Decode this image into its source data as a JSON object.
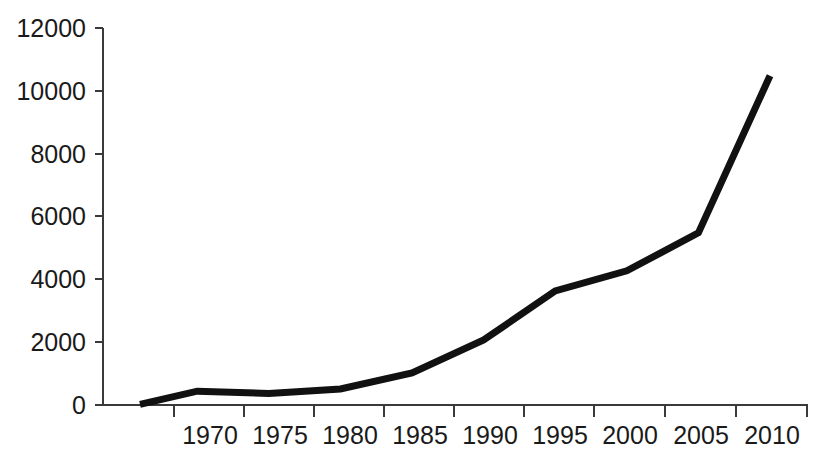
{
  "chart_data": {
    "type": "line",
    "title": "",
    "subtitle": "",
    "xlabel": "",
    "ylabel": "",
    "x": [
      1966,
      1970,
      1975,
      1980,
      1985,
      1990,
      1995,
      2000,
      2005,
      2010
    ],
    "categories": [
      "1966",
      "1970",
      "1975",
      "1980",
      "1985",
      "1990",
      "1995",
      "2000",
      "2005",
      "2010"
    ],
    "series": [
      {
        "name": "series-1",
        "color": "#111111",
        "values": [
          20,
          440,
          370,
          510,
          1020,
          2070,
          3630,
          4270,
          5480,
          10480
        ]
      }
    ],
    "xlim": [
      1963.5,
      2011.5
    ],
    "ylim": [
      0,
      12000
    ],
    "xticks": [
      1966,
      1970,
      1975,
      1980,
      1985,
      1990,
      1995,
      2000,
      2005,
      2010
    ],
    "xtick_labels": [
      "",
      "1970",
      "1975",
      "1980",
      "1985",
      "1990",
      "1995",
      "2000",
      "2005",
      "2010"
    ],
    "yticks": [
      0,
      2000,
      4000,
      6000,
      8000,
      10000,
      12000
    ],
    "ytick_labels": [
      "0",
      "2000",
      "4000",
      "6000",
      "8000",
      "10000",
      "12000"
    ],
    "grid": false,
    "legend": false,
    "legend_position": "none",
    "annotations": []
  },
  "axes": {
    "y_axis_color": "#3a3a3a",
    "x_axis_color": "#3a3a3a",
    "line_color": "#111111",
    "background": "#ffffff"
  },
  "labels": {
    "y": {
      "t0": "0",
      "t1": "2000",
      "t2": "4000",
      "t3": "6000",
      "t4": "8000",
      "t5": "10000",
      "t6": "12000"
    },
    "x": {
      "t1": "1970",
      "t2": "1975",
      "t3": "1980",
      "t4": "1985",
      "t5": "1990",
      "t6": "1995",
      "t7": "2000",
      "t8": "2005",
      "t9": "2010"
    }
  }
}
